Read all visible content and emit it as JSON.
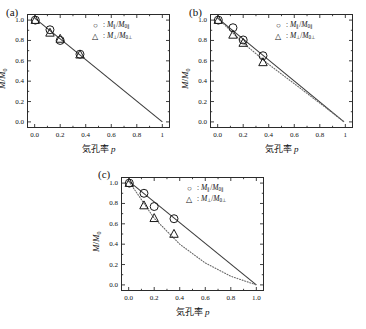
{
  "figure": {
    "axis_x_title": "気孔率 p",
    "axis_y_title": "M/M0",
    "marker_circle": "○",
    "marker_triangle": "△",
    "legend_sep": ":",
    "series_parallel_label": "M∥/M0∥",
    "series_perp_label": "M⊥/M0⊥",
    "colors": {
      "axis": "#2b2b2b",
      "marker": "#1a1a1a",
      "solid_line": "#3a3a3a",
      "dotted_line": "#6a6a6a",
      "background": "#ffffff"
    }
  },
  "chart_data": [
    {
      "type": "scatter",
      "panel": "(a)",
      "title": "",
      "xlabel": "気孔率 p",
      "ylabel": "M/M0",
      "xlim": [
        -0.06,
        1.06
      ],
      "ylim": [
        -0.06,
        1.06
      ],
      "xticks": [
        "0.0",
        "0.2",
        "0.4",
        "0.6",
        "0.8",
        "1"
      ],
      "xtick_values": [
        0.0,
        0.2,
        0.4,
        0.6,
        0.8,
        1.0
      ],
      "yticks": [
        "0.0",
        "0.2",
        "0.4",
        "0.6",
        "0.8",
        "1.0"
      ],
      "ytick_values": [
        0.0,
        0.2,
        0.4,
        0.6,
        0.8,
        1.0
      ],
      "grid": false,
      "legend_position": "top-right",
      "series": [
        {
          "name": "M∥/M0∥",
          "marker": "circle",
          "x": [
            0.005,
            0.12,
            0.2,
            0.355
          ],
          "values": [
            1.0,
            0.905,
            0.8,
            0.665
          ]
        },
        {
          "name": "M⊥/M0⊥",
          "marker": "triangle",
          "x": [
            0.005,
            0.12,
            0.2,
            0.355
          ],
          "values": [
            1.0,
            0.875,
            0.815,
            0.66
          ]
        }
      ],
      "lines": [
        {
          "style": "solid",
          "description": "linear fit from (0,1.02) to (1.0,0.0)",
          "x": [
            0.0,
            1.0
          ],
          "y": [
            1.02,
            0.0
          ]
        }
      ]
    },
    {
      "type": "scatter",
      "panel": "(b)",
      "title": "",
      "xlabel": "気孔率 p",
      "ylabel": "M/M0",
      "xlim": [
        -0.06,
        1.06
      ],
      "ylim": [
        -0.06,
        1.06
      ],
      "xticks": [
        "0.0",
        "0.2",
        "0.4",
        "0.6",
        "0.8",
        "1"
      ],
      "xtick_values": [
        0.0,
        0.2,
        0.4,
        0.6,
        0.8,
        1.0
      ],
      "yticks": [
        "0.0",
        "0.2",
        "0.4",
        "0.6",
        "0.8",
        "1.0"
      ],
      "ytick_values": [
        0.0,
        0.2,
        0.4,
        0.6,
        0.8,
        1.0
      ],
      "grid": false,
      "legend_position": "top-right",
      "series": [
        {
          "name": "M∥/M0∥",
          "marker": "circle",
          "x": [
            0.005,
            0.12,
            0.2,
            0.355
          ],
          "values": [
            1.0,
            0.925,
            0.805,
            0.65
          ]
        },
        {
          "name": "M⊥/M0⊥",
          "marker": "triangle",
          "x": [
            0.005,
            0.12,
            0.2,
            0.355
          ],
          "values": [
            1.0,
            0.855,
            0.775,
            0.585
          ]
        }
      ],
      "lines": [
        {
          "style": "solid",
          "description": "linear fit from (0,1.02) to (0.99,0.0)",
          "x": [
            0.0,
            0.99
          ],
          "y": [
            1.02,
            0.0
          ]
        },
        {
          "style": "dotted",
          "description": "curve slightly below solid, converging at p=1",
          "x": [
            0.0,
            0.2,
            0.4,
            0.6,
            0.8,
            0.99
          ],
          "y": [
            1.02,
            0.775,
            0.565,
            0.375,
            0.185,
            0.0
          ]
        }
      ]
    },
    {
      "type": "scatter",
      "panel": "(c)",
      "title": "",
      "xlabel": "気孔率 p",
      "ylabel": "M/M0",
      "xlim": [
        -0.06,
        1.06
      ],
      "ylim": [
        -0.06,
        1.06
      ],
      "xticks": [
        "0.0",
        "0.2",
        "0.4",
        "0.6",
        "0.8",
        "1.0"
      ],
      "xtick_values": [
        0.0,
        0.2,
        0.4,
        0.6,
        0.8,
        1.0
      ],
      "yticks": [
        "0.0",
        "0.2",
        "0.4",
        "0.6",
        "0.8",
        "1.0"
      ],
      "ytick_values": [
        0.0,
        0.2,
        0.4,
        0.6,
        0.8,
        1.0
      ],
      "grid": false,
      "legend_position": "top-right",
      "series": [
        {
          "name": "M∥/M0∥",
          "marker": "circle",
          "x": [
            0.005,
            0.12,
            0.2,
            0.355
          ],
          "values": [
            1.0,
            0.9,
            0.77,
            0.65
          ]
        },
        {
          "name": "M⊥/M0⊥",
          "marker": "triangle",
          "x": [
            0.005,
            0.12,
            0.2,
            0.355
          ],
          "values": [
            1.0,
            0.78,
            0.655,
            0.5
          ]
        }
      ],
      "lines": [
        {
          "style": "solid",
          "description": "linear fit from (0,1.02) to (1.0,0.0)",
          "x": [
            0.0,
            1.0
          ],
          "y": [
            1.02,
            0.0
          ]
        },
        {
          "style": "dotted",
          "description": "convex-down curve well below solid line",
          "x": [
            0.0,
            0.2,
            0.4,
            0.6,
            0.8,
            1.0
          ],
          "y": [
            1.02,
            0.655,
            0.4,
            0.215,
            0.085,
            0.0
          ]
        }
      ]
    }
  ]
}
